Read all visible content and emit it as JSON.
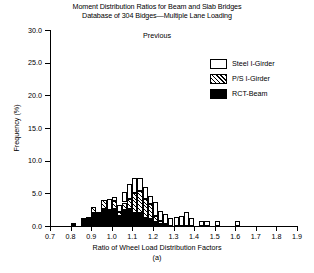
{
  "title": {
    "line1": "Moment Distribution Ratios for Beam and Slab Bridges",
    "line2": "Database of 304 Bidges—Multiple Lane Loading"
  },
  "previous_note": "Previous",
  "panel_label": "(a)",
  "legend": {
    "items": [
      {
        "label": "Steel I-Girder",
        "pattern": "steel",
        "color": "#ffffff"
      },
      {
        "label": "P/S I-Girder",
        "pattern": "ps",
        "color": "#808080"
      },
      {
        "label": "RCT-Beam",
        "pattern": "rct",
        "color": "#000000"
      }
    ]
  },
  "axes": {
    "y_ticks": [
      "0.0",
      "5.0",
      "10.0",
      "15.0",
      "20.0",
      "25.0",
      "30.0"
    ],
    "x_ticks": [
      "0.7",
      "0.8",
      "0.9",
      "1.0",
      "1.1",
      "1.2",
      "1.3",
      "1.4",
      "1.5",
      "1.6",
      "1.7",
      "1.8",
      "1.9"
    ]
  },
  "chart_data": {
    "type": "bar",
    "subtype": "stacked-histogram",
    "annotation": "Previous",
    "panel": "(a)",
    "xlabel": "Ratio of Wheel Load Distribution Factors",
    "ylabel": "Frequency (%)",
    "xlim": [
      0.7,
      1.9
    ],
    "ylim": [
      0.0,
      30.0
    ],
    "xtick_step": 0.1,
    "ytick_step": 5.0,
    "grid": false,
    "legend_position": "upper-right",
    "bin_width": 0.025,
    "bin_starts": [
      0.8,
      0.825,
      0.85,
      0.875,
      0.9,
      0.925,
      0.95,
      0.975,
      1.0,
      1.025,
      1.05,
      1.075,
      1.1,
      1.125,
      1.15,
      1.175,
      1.2,
      1.225,
      1.25,
      1.275,
      1.3,
      1.325,
      1.35,
      1.375,
      1.4,
      1.425,
      1.45,
      1.475,
      1.5,
      1.525,
      1.55,
      1.575,
      1.6,
      1.625
    ],
    "series": [
      {
        "name": "RCT-Beam",
        "pattern": "solid-black",
        "values": [
          0.4,
          0.0,
          1.2,
          1.4,
          2.0,
          2.2,
          2.6,
          2.4,
          2.6,
          1.6,
          2.4,
          2.6,
          2.0,
          2.0,
          1.2,
          1.0,
          0.6,
          0.3,
          0.0,
          0.0,
          0.0,
          0.0,
          0.0,
          0.0,
          0.0,
          0.0,
          0.0,
          0.0,
          0.0,
          0.0,
          0.0,
          0.0,
          0.0,
          0.0
        ]
      },
      {
        "name": "P/S I-Girder",
        "pattern": "diagonal-hatch",
        "values": [
          0.0,
          0.0,
          0.0,
          0.0,
          0.9,
          0.0,
          1.4,
          0.0,
          1.2,
          0.6,
          1.2,
          1.6,
          3.0,
          3.4,
          3.0,
          2.4,
          1.0,
          0.5,
          0.3,
          0.0,
          0.0,
          0.0,
          0.0,
          0.0,
          0.0,
          0.0,
          0.0,
          0.0,
          0.0,
          0.0,
          0.0,
          0.0,
          0.0,
          0.0
        ]
      },
      {
        "name": "Steel I-Girder",
        "pattern": "open-white",
        "values": [
          0.0,
          0.0,
          0.0,
          0.0,
          0.0,
          0.0,
          0.0,
          1.8,
          0.6,
          1.0,
          1.6,
          2.2,
          2.4,
          2.0,
          1.8,
          1.2,
          2.0,
          1.5,
          1.5,
          1.3,
          1.4,
          1.6,
          2.2,
          1.2,
          0.0,
          0.8,
          0.7,
          0.0,
          0.7,
          0.0,
          0.0,
          0.0,
          0.7,
          0.0
        ]
      }
    ],
    "totals": [
      0.4,
      0.0,
      1.2,
      1.4,
      2.9,
      2.2,
      4.0,
      4.2,
      4.4,
      3.2,
      5.2,
      6.4,
      7.4,
      7.4,
      6.0,
      4.6,
      3.6,
      2.3,
      1.8,
      1.3,
      1.4,
      1.6,
      2.2,
      1.2,
      0.0,
      0.8,
      0.7,
      0.0,
      0.7,
      0.0,
      0.0,
      0.0,
      0.7,
      0.0
    ]
  }
}
